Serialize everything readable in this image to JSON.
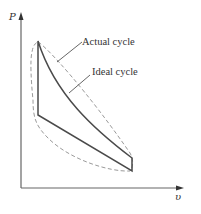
{
  "diagram": {
    "type": "p-v diagram",
    "axes": {
      "y_label": "P",
      "x_label": "υ"
    },
    "labels": {
      "actual_cycle": "Actual cycle",
      "ideal_cycle": "Ideal cycle"
    },
    "colors": {
      "axis": "#666666",
      "ideal_cycle": "#4a4a4a",
      "actual_cycle": "#9a9a9a",
      "text": "#333333"
    },
    "line_styles": {
      "ideal_cycle": "solid",
      "actual_cycle": "dashed"
    }
  }
}
